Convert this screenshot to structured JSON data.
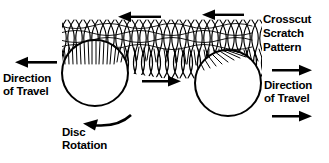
{
  "diagram": {
    "title": "Crosscut Scratch Pattern",
    "background_color": "#ffffff",
    "ink_color": "#000000",
    "labels": {
      "crosscut_scratch_pattern": "Crosscut\nScratch\nPattern",
      "direction_of_travel_left": "Direction\nof Travel",
      "direction_of_travel_right": "Direction\nof Travel",
      "disc_rotation": "Disc\nRotation"
    },
    "shapes": {
      "disc_left": {
        "cx": 95,
        "cy": 73,
        "r": 33
      },
      "disc_right": {
        "cx": 228,
        "cy": 83,
        "r": 33
      },
      "scratch_band": {
        "x_start": 62,
        "x_end": 262,
        "y_top": 22,
        "y_bottom": 62,
        "description": "crosscut scratch pattern"
      }
    },
    "arrows": {
      "top_left_arrow": {
        "direction": "left",
        "x1": 160,
        "y1": 17,
        "x2": 122,
        "y2": 17
      },
      "top_right_arrow": {
        "direction": "left",
        "x1": 243,
        "y1": 15,
        "x2": 205,
        "y2": 15
      },
      "left_travel_arrow": {
        "direction": "left",
        "x1": 56,
        "y1": 62,
        "x2": 16,
        "y2": 62
      },
      "middle_arrow": {
        "direction": "right",
        "x1": 142,
        "y1": 81,
        "x2": 180,
        "y2": 81
      },
      "right_travel_arrow_top": {
        "direction": "right",
        "x1": 272,
        "y1": 70,
        "x2": 312,
        "y2": 70
      },
      "right_travel_arrow_bottom": {
        "direction": "right",
        "x1": 272,
        "y1": 116,
        "x2": 312,
        "y2": 116
      },
      "disc_rotation_arrow": {
        "direction": "counterclockwise",
        "description": "curved arrow beneath left disc"
      }
    }
  }
}
